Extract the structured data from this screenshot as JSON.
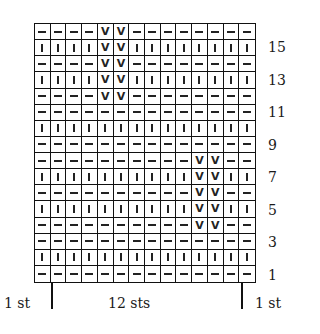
{
  "chart_data": {
    "type": "knitting-chart",
    "columns": 14,
    "rows": 16,
    "legend": {
      "-": "purl",
      "|": "knit",
      "V": "slip"
    },
    "grid_top_to_bottom": [
      "----VV--------",
      "||||VV||||||||",
      "----VV--------",
      "||||VV||||||||",
      "----VV--------",
      "--------------",
      "||||||||||||||",
      "--------------",
      "----------VV--",
      "||||||||||VV||",
      "----------VV--",
      "||||||||||VV||",
      "----------VV--",
      "--------------",
      "||||||||||||||",
      "--------------"
    ],
    "row_labels": [
      "15",
      "13",
      "11",
      "9",
      "7",
      "5",
      "3",
      "1"
    ],
    "bottom_labels": {
      "left": "1 st",
      "center": "12 sts",
      "right": "1 st"
    }
  },
  "row_labels": [
    {
      "text": "15",
      "row": 2
    },
    {
      "text": "13",
      "row": 4
    },
    {
      "text": "11",
      "row": 6
    },
    {
      "text": "9",
      "row": 8
    },
    {
      "text": "7",
      "row": 10
    },
    {
      "text": "5",
      "row": 12
    },
    {
      "text": "3",
      "row": 14
    },
    {
      "text": "1",
      "row": 16
    }
  ],
  "bottom": {
    "left": "1 st",
    "center": "12 sts",
    "right": "1 st"
  }
}
